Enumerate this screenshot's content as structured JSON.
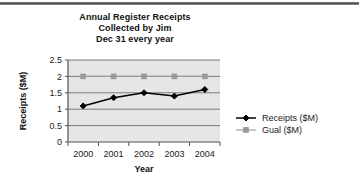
{
  "chart_data": {
    "type": "line",
    "title": "Annual Register Receipts Collected by Jim Dec 31 every year",
    "title_lines": [
      "Annual Register Receipts",
      "Collected by Jim",
      "Dec 31 every year"
    ],
    "xlabel": "Year",
    "ylabel": "Receipts ($M)",
    "categories": [
      "2000",
      "2001",
      "2002",
      "2003",
      "2004"
    ],
    "x_tick_labels": [
      "2000",
      "2001",
      "2002",
      "2003",
      "2004"
    ],
    "y_tick_labels": [
      "0",
      "0.5",
      "1",
      "1.5",
      "2",
      "2.5"
    ],
    "y_ticks": [
      0,
      0.5,
      1,
      1.5,
      2,
      2.5
    ],
    "ylim": [
      0,
      2.5
    ],
    "grid": true,
    "grid_axis": "y",
    "legend_position": "right",
    "plot_background": "#e6e6e6",
    "series": [
      {
        "name": "Receipts ($M)",
        "values": [
          1.1,
          1.35,
          1.5,
          1.4,
          1.6
        ],
        "color": "#000000",
        "marker": "diamond"
      },
      {
        "name": "Gual ($M)",
        "values": [
          2,
          2,
          2,
          2,
          2
        ],
        "color": "#9a9a9a",
        "marker": "square"
      }
    ]
  },
  "legend": {
    "items": [
      {
        "label": "Receipts ($M)",
        "color": "#000000",
        "marker": "diamond"
      },
      {
        "label": "Gual ($M)",
        "color": "#9a9a9a",
        "marker": "square"
      }
    ]
  }
}
